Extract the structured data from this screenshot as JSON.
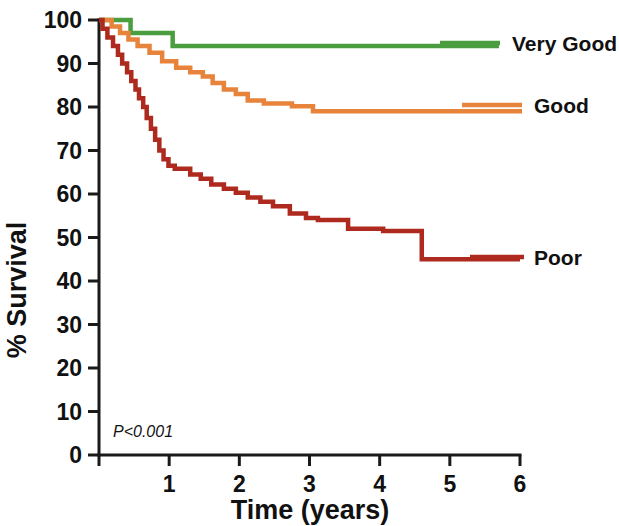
{
  "chart_data": {
    "type": "line",
    "subtype": "kaplan-meier-survival",
    "title": "",
    "xlabel": "Time (years)",
    "ylabel": "% Survival",
    "xlim": [
      0,
      6
    ],
    "ylim": [
      0,
      100
    ],
    "xticks": [
      0,
      1,
      2,
      3,
      4,
      5,
      6
    ],
    "xtick_labels": [
      "0",
      "1",
      "2",
      "3",
      "4",
      "5",
      "6"
    ],
    "yticks": [
      0,
      10,
      20,
      30,
      40,
      50,
      60,
      70,
      80,
      90,
      100
    ],
    "ytick_labels": [
      "0",
      "10",
      "20",
      "30",
      "40",
      "50",
      "60",
      "70",
      "80",
      "90",
      "100"
    ],
    "grid": false,
    "legend_position": "right-inline",
    "annotations": [
      {
        "name": "p-value",
        "text": "P<0.001",
        "x": 0.25,
        "y": 6
      }
    ],
    "colors": {
      "very_good": "#4a9e3f",
      "good": "#e8833c",
      "poor": "#ae2a1e",
      "axis": "#1a1a1a",
      "text": "#111111",
      "background": "#ffffff"
    },
    "series": [
      {
        "name": "Very Good",
        "label": "Very Good",
        "color": "#4a9e3f",
        "final_survival": 94,
        "points": [
          [
            0.0,
            100
          ],
          [
            0.45,
            100
          ],
          [
            0.45,
            97
          ],
          [
            1.05,
            97
          ],
          [
            1.05,
            94
          ],
          [
            5.7,
            94
          ]
        ]
      },
      {
        "name": "Good",
        "label": "Good",
        "color": "#e8833c",
        "final_survival": 79,
        "points": [
          [
            0.0,
            100
          ],
          [
            0.18,
            100
          ],
          [
            0.18,
            98.5
          ],
          [
            0.3,
            98.5
          ],
          [
            0.3,
            97
          ],
          [
            0.42,
            97
          ],
          [
            0.42,
            95.5
          ],
          [
            0.55,
            95.5
          ],
          [
            0.55,
            94
          ],
          [
            0.72,
            94
          ],
          [
            0.72,
            92.5
          ],
          [
            0.9,
            92.5
          ],
          [
            0.9,
            90.5
          ],
          [
            1.1,
            90.5
          ],
          [
            1.1,
            89
          ],
          [
            1.3,
            89
          ],
          [
            1.3,
            88
          ],
          [
            1.48,
            88
          ],
          [
            1.48,
            87
          ],
          [
            1.62,
            87
          ],
          [
            1.62,
            85.5
          ],
          [
            1.78,
            85.5
          ],
          [
            1.78,
            84
          ],
          [
            1.95,
            84
          ],
          [
            1.95,
            83
          ],
          [
            2.12,
            83
          ],
          [
            2.12,
            81.5
          ],
          [
            2.35,
            81.5
          ],
          [
            2.35,
            80.8
          ],
          [
            2.75,
            80.8
          ],
          [
            2.75,
            80.2
          ],
          [
            3.05,
            80.2
          ],
          [
            3.05,
            79
          ],
          [
            7.4,
            79
          ]
        ]
      },
      {
        "name": "Poor",
        "label": "Poor",
        "color": "#ae2a1e",
        "final_survival": 45,
        "points": [
          [
            0.0,
            100
          ],
          [
            0.05,
            100
          ],
          [
            0.05,
            98
          ],
          [
            0.12,
            98
          ],
          [
            0.12,
            96
          ],
          [
            0.2,
            96
          ],
          [
            0.2,
            94
          ],
          [
            0.27,
            94
          ],
          [
            0.27,
            92
          ],
          [
            0.33,
            92
          ],
          [
            0.33,
            90
          ],
          [
            0.4,
            90
          ],
          [
            0.4,
            88
          ],
          [
            0.46,
            88
          ],
          [
            0.46,
            86
          ],
          [
            0.52,
            86
          ],
          [
            0.52,
            84
          ],
          [
            0.57,
            84
          ],
          [
            0.57,
            82
          ],
          [
            0.63,
            82
          ],
          [
            0.63,
            80
          ],
          [
            0.68,
            80
          ],
          [
            0.68,
            77.5
          ],
          [
            0.74,
            77.5
          ],
          [
            0.74,
            75
          ],
          [
            0.8,
            75
          ],
          [
            0.8,
            72.5
          ],
          [
            0.86,
            72.5
          ],
          [
            0.86,
            70
          ],
          [
            0.92,
            70
          ],
          [
            0.92,
            68
          ],
          [
            0.99,
            68
          ],
          [
            0.99,
            66.5
          ],
          [
            1.08,
            66.5
          ],
          [
            1.08,
            65.8
          ],
          [
            1.3,
            65.8
          ],
          [
            1.3,
            64.5
          ],
          [
            1.45,
            64.5
          ],
          [
            1.45,
            63.5
          ],
          [
            1.6,
            63.5
          ],
          [
            1.6,
            62.2
          ],
          [
            1.78,
            62.2
          ],
          [
            1.78,
            61.2
          ],
          [
            1.95,
            61.2
          ],
          [
            1.95,
            60.3
          ],
          [
            2.12,
            60.3
          ],
          [
            2.12,
            59.2
          ],
          [
            2.3,
            59.2
          ],
          [
            2.3,
            58.2
          ],
          [
            2.48,
            58.2
          ],
          [
            2.48,
            57.2
          ],
          [
            2.72,
            57.2
          ],
          [
            2.72,
            55.5
          ],
          [
            2.95,
            55.5
          ],
          [
            2.95,
            54.5
          ],
          [
            3.12,
            54.5
          ],
          [
            3.12,
            54.0
          ],
          [
            3.55,
            54.0
          ],
          [
            3.55,
            52.0
          ],
          [
            4.05,
            52.0
          ],
          [
            4.05,
            51.5
          ],
          [
            4.6,
            51.5
          ],
          [
            4.6,
            45.0
          ],
          [
            6.0,
            45.0
          ]
        ]
      }
    ]
  },
  "legend": {
    "entries": [
      {
        "label": "Very Good",
        "color": "#4a9e3f"
      },
      {
        "label": "Good",
        "color": "#e8833c"
      },
      {
        "label": "Poor",
        "color": "#ae2a1e"
      }
    ]
  },
  "axes": {
    "x_title": "Time (years)",
    "y_title": "% Survival"
  },
  "stats": {
    "p_value_text": "P<0.001"
  }
}
